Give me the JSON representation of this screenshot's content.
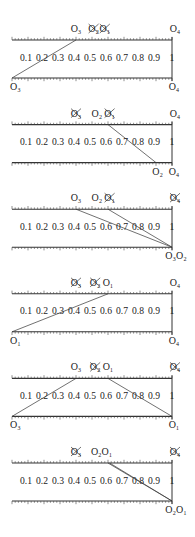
{
  "figure": {
    "scale_labels": [
      "0.1",
      "0.2",
      "0.3",
      "0.4",
      "0.5",
      "0.6",
      "0.7",
      "0.8",
      "0.9",
      "1"
    ],
    "panels": [
      {
        "top_labels": [
          {
            "text": "O₃",
            "pos": 0.4,
            "crossed": false
          },
          {
            "text": "O₂",
            "pos": 0.51,
            "crossed": true
          },
          {
            "text": "O₁",
            "pos": 0.58,
            "crossed": true
          },
          {
            "text": "O₄",
            "pos": 1.0,
            "crossed": false
          }
        ],
        "bottom_labels": [
          {
            "text": "O₃",
            "pos": 0.0
          },
          {
            "text": "O₄",
            "pos": 1.0
          }
        ],
        "lines": [
          {
            "from": 0.4,
            "to": 0.0
          }
        ]
      },
      {
        "top_labels": [
          {
            "text": "O₃",
            "pos": 0.4,
            "crossed": true
          },
          {
            "text": "O₂",
            "pos": 0.53,
            "crossed": false
          },
          {
            "text": "O₁",
            "pos": 0.61,
            "crossed": true
          },
          {
            "text": "O₄",
            "pos": 1.0,
            "crossed": false
          }
        ],
        "bottom_labels": [
          {
            "text": "O₂",
            "pos": 0.91
          },
          {
            "text": "O₄",
            "pos": 1.0
          }
        ],
        "lines": [
          {
            "from": 0.6,
            "to": 0.9
          }
        ]
      },
      {
        "top_labels": [
          {
            "text": "O₃",
            "pos": 0.4,
            "crossed": false
          },
          {
            "text": "O₂",
            "pos": 0.53,
            "crossed": false
          },
          {
            "text": "O₁",
            "pos": 0.61,
            "crossed": true
          },
          {
            "text": "O₄",
            "pos": 1.0,
            "crossed": true
          }
        ],
        "bottom_labels": [
          {
            "text": "O₃O₂",
            "pos": 1.0
          }
        ],
        "lines": [
          {
            "from": 0.4,
            "to": 1.0
          },
          {
            "from": 0.6,
            "to": 1.0
          }
        ]
      },
      {
        "top_labels": [
          {
            "text": "O₃",
            "pos": 0.4,
            "crossed": true
          },
          {
            "text": "O₂",
            "pos": 0.52,
            "crossed": true
          },
          {
            "text": "O₁",
            "pos": 0.6,
            "crossed": false
          },
          {
            "text": "O₄",
            "pos": 1.0,
            "crossed": false
          }
        ],
        "bottom_labels": [
          {
            "text": "O₁",
            "pos": 0.0
          },
          {
            "text": "O₄",
            "pos": 1.0
          }
        ],
        "lines": [
          {
            "from": 0.6,
            "to": 0.0
          }
        ]
      },
      {
        "top_labels": [
          {
            "text": "O₃",
            "pos": 0.4,
            "crossed": false
          },
          {
            "text": "O₂",
            "pos": 0.52,
            "crossed": true
          },
          {
            "text": "O₁",
            "pos": 0.6,
            "crossed": false
          },
          {
            "text": "O₄",
            "pos": 1.0,
            "crossed": true
          }
        ],
        "bottom_labels": [
          {
            "text": "O₃",
            "pos": 0.0
          },
          {
            "text": "O₁",
            "pos": 1.0
          }
        ],
        "lines": [
          {
            "from": 0.4,
            "to": 0.0
          },
          {
            "from": 0.6,
            "to": 1.0
          }
        ]
      },
      {
        "top_labels": [
          {
            "text": "O₃",
            "pos": 0.4,
            "crossed": true
          },
          {
            "text": "O₂O₁",
            "pos": 0.56,
            "crossed": false
          },
          {
            "text": "O₄",
            "pos": 1.0,
            "crossed": true
          }
        ],
        "bottom_labels": [
          {
            "text": "O₂O₁",
            "pos": 1.0
          }
        ],
        "lines": [
          {
            "from": 0.6,
            "to": 1.0
          },
          {
            "from": 0.61,
            "to": 1.0
          }
        ]
      }
    ]
  }
}
